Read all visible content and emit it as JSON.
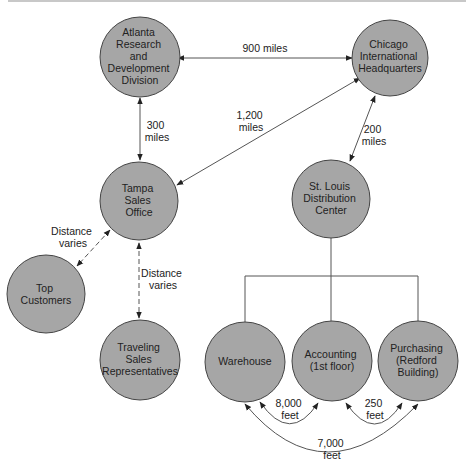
{
  "nodes": {
    "atlanta": {
      "lines": [
        "Atlanta",
        "Research",
        "and",
        "Development",
        "Division"
      ]
    },
    "chicago": {
      "lines": [
        "Chicago",
        "International",
        "Headquarters"
      ]
    },
    "tampa": {
      "lines": [
        "Tampa",
        "Sales",
        "Office"
      ]
    },
    "stlouis": {
      "lines": [
        "St. Louis",
        "Distribution",
        "Center"
      ]
    },
    "customers": {
      "lines": [
        "Top",
        "Customers"
      ]
    },
    "reps": {
      "lines": [
        "Traveling",
        "Sales",
        "Representatives"
      ]
    },
    "warehouse": {
      "lines": [
        "Warehouse"
      ]
    },
    "accounting": {
      "lines": [
        "Accounting",
        "(1st floor)"
      ]
    },
    "purchasing": {
      "lines": [
        "Purchasing",
        "(Redford",
        "Building)"
      ]
    }
  },
  "edges": {
    "atlanta_chicago": {
      "lines": [
        "900 miles"
      ]
    },
    "atlanta_tampa": {
      "lines": [
        "300",
        "miles"
      ]
    },
    "chicago_tampa": {
      "lines": [
        "1,200",
        "miles"
      ]
    },
    "chicago_stlouis": {
      "lines": [
        "200",
        "miles"
      ]
    },
    "tampa_customers": {
      "lines": [
        "Distance",
        "varies"
      ]
    },
    "tampa_reps": {
      "lines": [
        "Distance",
        "varies"
      ]
    },
    "warehouse_accounting": {
      "lines": [
        "8,000",
        "feet"
      ]
    },
    "accounting_purchasing": {
      "lines": [
        "250",
        "feet"
      ]
    },
    "warehouse_purchasing": {
      "lines": [
        "7,000",
        "feet"
      ]
    }
  },
  "colors": {
    "node_fill": "#a6a6a6",
    "stroke": "#444444",
    "background": "#ffffff"
  }
}
